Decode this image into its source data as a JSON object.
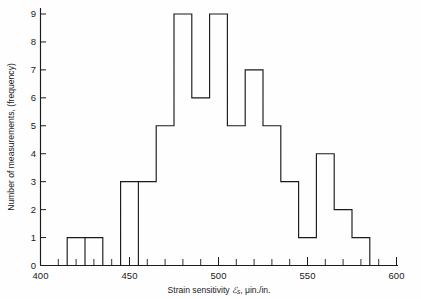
{
  "chart_data": {
    "type": "bar",
    "title": "",
    "subtitle": "",
    "xlabel": "Strain sensitivity ℰs, μin./in.",
    "xlabel_parts": {
      "prefix": "Strain sensitivity ",
      "symbol": "ℰ",
      "subscript": "s",
      "suffix": ", μin./in."
    },
    "ylabel": "Number of measurements, (frequency)",
    "xlim": [
      400,
      600
    ],
    "ylim": [
      0,
      9
    ],
    "xticks": [
      400,
      450,
      500,
      550,
      600
    ],
    "xtick_labels": [
      "400",
      "450",
      "500",
      "550",
      "600"
    ],
    "xticks_minor": [
      410,
      420,
      430,
      440,
      460,
      470,
      480,
      490,
      510,
      520,
      530,
      540,
      560,
      570,
      580,
      590
    ],
    "yticks": [
      0,
      1,
      2,
      3,
      4,
      5,
      6,
      7,
      8,
      9
    ],
    "ytick_labels": [
      "0",
      "1",
      "2",
      "3",
      "4",
      "5",
      "6",
      "7",
      "8",
      "9"
    ],
    "grid": false,
    "legend": false,
    "bin_width": 10,
    "bin_edges": [
      415,
      425,
      435,
      445,
      455,
      465,
      475,
      485,
      495,
      505,
      515,
      525,
      535,
      545,
      555,
      565,
      575,
      585
    ],
    "categories": [
      "415-425",
      "425-435",
      "435-445",
      "445-455",
      "455-465",
      "465-475",
      "475-485",
      "485-495",
      "495-505",
      "505-515",
      "515-525",
      "525-535",
      "535-545",
      "545-555",
      "555-565",
      "565-575",
      "575-585"
    ],
    "values": [
      1,
      1,
      0,
      3,
      3,
      5,
      9,
      6,
      9,
      5,
      7,
      5,
      3,
      1,
      4,
      2,
      1
    ],
    "bar_color": "none",
    "line_color": "#1b1b1b",
    "total_count": 65
  },
  "figure": {
    "background": "#fefefe",
    "axis_color": "#1b1b1b"
  }
}
